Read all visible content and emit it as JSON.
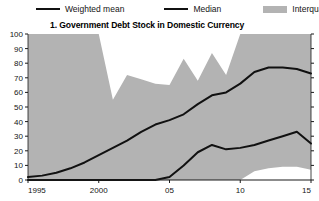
{
  "legend": {
    "items": [
      {
        "label": "Weighted mean",
        "type": "line",
        "color": "#111111",
        "icon": "line-swatch-icon"
      },
      {
        "label": "Median",
        "type": "line",
        "color": "#111111",
        "icon": "line-swatch-icon"
      },
      {
        "label": "Interquartile range",
        "type": "band",
        "color": "#b3b3b3",
        "icon": "band-swatch-icon"
      }
    ]
  },
  "chart_data": {
    "type": "area",
    "title": "1. Government Debt Stock in Domestic Currency",
    "xlabel": "",
    "ylabel": "",
    "xlim": [
      1995,
      2015
    ],
    "ylim": [
      0,
      100
    ],
    "yticks": [
      0,
      10,
      20,
      30,
      40,
      50,
      60,
      70,
      80,
      90,
      100
    ],
    "ytick_labels": [
      "0",
      "10",
      "20",
      "30",
      "40",
      "50",
      "60",
      "70",
      "80",
      "90",
      "100"
    ],
    "xticks": [
      1995,
      2000,
      2005,
      2010,
      2015
    ],
    "xtick_labels": [
      "1995",
      "2000",
      "05",
      "10",
      "15"
    ],
    "grid": false,
    "legend_position": "above-top",
    "x": [
      1995,
      1996,
      1997,
      1998,
      1999,
      2000,
      2001,
      2002,
      2003,
      2004,
      2005,
      2006,
      2007,
      2008,
      2009,
      2010,
      2011,
      2012,
      2013,
      2014,
      2015
    ],
    "band": {
      "name": "Interquartile range",
      "color": "#b3b3b3",
      "upper": [
        100,
        100,
        100,
        100,
        100,
        100,
        55,
        72,
        69,
        66,
        65,
        83,
        68,
        87,
        72,
        100,
        100,
        100,
        100,
        100,
        100
      ],
      "lower": [
        0,
        0,
        0,
        0,
        0,
        0,
        0,
        0,
        0,
        0,
        0,
        0,
        0,
        0,
        0,
        0,
        6,
        8,
        9,
        9,
        7
      ]
    },
    "series": [
      {
        "name": "Weighted mean",
        "color": "#111111",
        "values": [
          2,
          3,
          5,
          8,
          12,
          17,
          22,
          27,
          33,
          38,
          41,
          45,
          52,
          58,
          60,
          66,
          74,
          77,
          77,
          76,
          73
        ]
      },
      {
        "name": "Median",
        "color": "#111111",
        "values": [
          0,
          0,
          0,
          0,
          0,
          0,
          0,
          0,
          0,
          0,
          2,
          10,
          19,
          24,
          21,
          22,
          24,
          27,
          30,
          33,
          25
        ]
      }
    ]
  },
  "axes": {
    "y_axis_name": "y-axis",
    "x_axis_name": "x-axis"
  }
}
